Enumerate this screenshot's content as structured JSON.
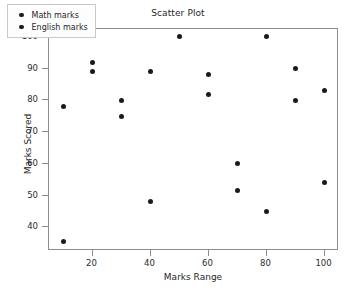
{
  "chart_data": {
    "type": "scatter",
    "title": "Scatter Plot",
    "xlabel": "Marks Range",
    "ylabel": "Marks Scored",
    "xlim": [
      5,
      105
    ],
    "ylim": [
      32.5,
      102.5
    ],
    "xticks": [
      20,
      40,
      60,
      80,
      100
    ],
    "yticks": [
      40,
      50,
      60,
      70,
      80,
      90,
      100
    ],
    "grid": false,
    "legend_position": "upper left",
    "series": [
      {
        "name": "Math marks",
        "color": "#1a1a1a",
        "x": [
          10,
          20,
          30,
          40,
          50,
          60,
          70,
          80,
          90,
          100
        ],
        "y": [
          78,
          92,
          80,
          89,
          100,
          88,
          60,
          100,
          90,
          83
        ]
      },
      {
        "name": "English marks",
        "color": "#1a1a1a",
        "x": [
          10,
          20,
          30,
          40,
          60,
          70,
          80,
          90,
          100
        ],
        "y": [
          35.5,
          89,
          75,
          48,
          82,
          51.5,
          45,
          80,
          54
        ]
      }
    ]
  },
  "legend": {
    "items": [
      {
        "label": "Math marks",
        "marker": "filled-circle-marker"
      },
      {
        "label": "English marks",
        "marker": "filled-circle-marker"
      }
    ]
  }
}
